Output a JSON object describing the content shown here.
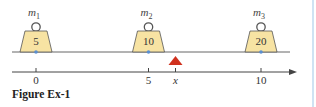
{
  "figure": {
    "caption": "Figure Ex-1",
    "colors": {
      "weight_fill": "#f7e3a3",
      "weight_stroke": "#555555",
      "beam": "#666666",
      "axis": "#444444",
      "pivot": "#d0311e",
      "contact_dot": "#5b8fd0",
      "edge_line": "#cfe3f3"
    },
    "masses": [
      {
        "label": "m",
        "subscript": "1",
        "value": "5",
        "position": 0
      },
      {
        "label": "m",
        "subscript": "2",
        "value": "10",
        "position": 5
      },
      {
        "label": "m",
        "subscript": "3",
        "value": "20",
        "position": 10
      }
    ],
    "axis": {
      "ticks": [
        {
          "label": "0",
          "position": 0,
          "italic": false
        },
        {
          "label": "5",
          "position": 5,
          "italic": false
        },
        {
          "label": "x",
          "position": 6.2,
          "italic": true
        },
        {
          "label": "10",
          "position": 10,
          "italic": false
        }
      ]
    },
    "pivot": {
      "label": "fulcrum",
      "position": 6.2
    }
  }
}
